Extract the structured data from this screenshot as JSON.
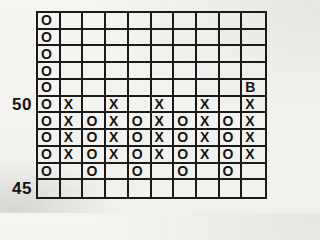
{
  "figure": {
    "background_color": "#f3f2ef",
    "line_color": "#1a1a1a",
    "mark_color": "#141414"
  },
  "axis": {
    "labels": [
      {
        "text": "50",
        "row": 5
      },
      {
        "text": "45",
        "row": 10
      }
    ]
  },
  "chart_data": {
    "type": "table",
    "subtype": "point-and-figure",
    "title": "",
    "n_cols": 10,
    "n_rows": 11,
    "y_tick_labels": [
      "50",
      "45"
    ],
    "y_tick_rows": [
      5,
      10
    ],
    "box_size": 1,
    "price_top_row": 55,
    "price_bottom_row": 45,
    "grid": [
      [
        "O",
        "",
        "",
        "",
        "",
        "",
        "",
        "",
        "",
        ""
      ],
      [
        "O",
        "",
        "",
        "",
        "",
        "",
        "",
        "",
        "",
        ""
      ],
      [
        "O",
        "",
        "",
        "",
        "",
        "",
        "",
        "",
        "",
        ""
      ],
      [
        "O",
        "",
        "",
        "",
        "",
        "",
        "",
        "",
        "",
        ""
      ],
      [
        "O",
        "",
        "",
        "",
        "",
        "",
        "",
        "",
        "",
        "B"
      ],
      [
        "O",
        "X",
        "",
        "X",
        "",
        "X",
        "",
        "X",
        "",
        "X"
      ],
      [
        "O",
        "X",
        "O",
        "X",
        "O",
        "X",
        "O",
        "X",
        "O",
        "X"
      ],
      [
        "O",
        "X",
        "O",
        "X",
        "O",
        "X",
        "O",
        "X",
        "O",
        "X"
      ],
      [
        "O",
        "X",
        "O",
        "X",
        "O",
        "X",
        "O",
        "X",
        "O",
        "X"
      ],
      [
        "O",
        "",
        "O",
        "",
        "O",
        "",
        "O",
        "",
        "O",
        ""
      ],
      [
        "",
        "",
        "",
        "",
        "",
        "",
        "",
        "",
        "",
        ""
      ]
    ],
    "annotations": [
      {
        "text": "B",
        "row": 4,
        "col": 9,
        "meaning": "buy-signal marker at price 51"
      }
    ]
  }
}
